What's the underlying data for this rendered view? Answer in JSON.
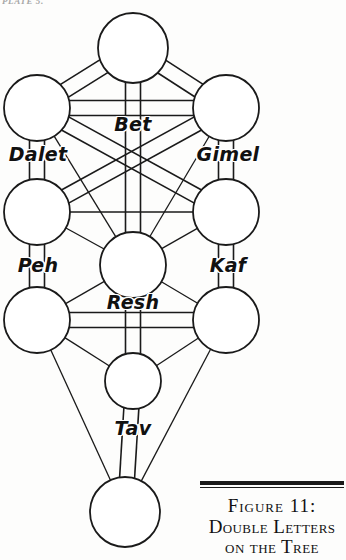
{
  "page": {
    "running_head": "PLATE 5.",
    "width": 346,
    "height": 560,
    "background_color": "#fdfdfc",
    "ink_color": "#1a1a1a"
  },
  "figure": {
    "node_stroke_color": "#1a1a1a",
    "node_fill_color": "#ffffff",
    "path_stroke_color": "#1a1a1a"
  },
  "nodes": [
    {
      "id": "keter",
      "cx": 133,
      "cy": 48,
      "r": 35
    },
    {
      "id": "binah",
      "cx": 37,
      "cy": 108,
      "r": 33
    },
    {
      "id": "chokhmah",
      "cx": 226,
      "cy": 108,
      "r": 33
    },
    {
      "id": "gevurah",
      "cx": 37,
      "cy": 212,
      "r": 33
    },
    {
      "id": "chesed",
      "cx": 226,
      "cy": 212,
      "r": 33
    },
    {
      "id": "tiferet",
      "cx": 133,
      "cy": 265,
      "r": 33
    },
    {
      "id": "hod",
      "cx": 37,
      "cy": 320,
      "r": 33
    },
    {
      "id": "netzach",
      "cx": 226,
      "cy": 320,
      "r": 33
    },
    {
      "id": "yesod",
      "cx": 133,
      "cy": 381,
      "r": 28
    },
    {
      "id": "malkuth",
      "cx": 125,
      "cy": 512,
      "r": 35
    }
  ],
  "paths": [
    {
      "from": "keter",
      "to": "binah",
      "doubled": true
    },
    {
      "from": "keter",
      "to": "chokhmah",
      "doubled": true
    },
    {
      "from": "keter",
      "to": "tiferet",
      "doubled": true
    },
    {
      "from": "binah",
      "to": "chokhmah",
      "doubled": true
    },
    {
      "from": "binah",
      "to": "gevurah",
      "doubled": true
    },
    {
      "from": "chokhmah",
      "to": "chesed",
      "doubled": true
    },
    {
      "from": "binah",
      "to": "tiferet",
      "doubled": false
    },
    {
      "from": "chokhmah",
      "to": "tiferet",
      "doubled": false
    },
    {
      "from": "binah",
      "to": "chesed",
      "doubled": true
    },
    {
      "from": "chokhmah",
      "to": "gevurah",
      "doubled": true
    },
    {
      "from": "gevurah",
      "to": "chesed",
      "doubled": false
    },
    {
      "from": "gevurah",
      "to": "tiferet",
      "doubled": false
    },
    {
      "from": "chesed",
      "to": "tiferet",
      "doubled": false
    },
    {
      "from": "gevurah",
      "to": "hod",
      "doubled": true
    },
    {
      "from": "chesed",
      "to": "netzach",
      "doubled": true
    },
    {
      "from": "hod",
      "to": "netzach",
      "doubled": true
    },
    {
      "from": "hod",
      "to": "tiferet",
      "doubled": false
    },
    {
      "from": "netzach",
      "to": "tiferet",
      "doubled": false
    },
    {
      "from": "tiferet",
      "to": "yesod",
      "doubled": true
    },
    {
      "from": "hod",
      "to": "yesod",
      "doubled": false
    },
    {
      "from": "netzach",
      "to": "yesod",
      "doubled": false
    },
    {
      "from": "yesod",
      "to": "malkuth",
      "doubled": true
    },
    {
      "from": "hod",
      "to": "malkuth",
      "doubled": false
    },
    {
      "from": "netzach",
      "to": "malkuth",
      "doubled": false
    }
  ],
  "labels": [
    {
      "id": "bet",
      "text": "Bet",
      "x": 133,
      "y": 124,
      "size": 19
    },
    {
      "id": "dalet",
      "text": "Dalet",
      "x": 38,
      "y": 154,
      "size": 19
    },
    {
      "id": "gimel",
      "text": "Gimel",
      "x": 228,
      "y": 154,
      "size": 19
    },
    {
      "id": "peh",
      "text": "Peh",
      "x": 38,
      "y": 265,
      "size": 19
    },
    {
      "id": "kaf",
      "text": "Kaf",
      "x": 228,
      "y": 265,
      "size": 19
    },
    {
      "id": "resh",
      "text": "Resh",
      "x": 133,
      "y": 302,
      "size": 19
    },
    {
      "id": "tav",
      "text": "Tav",
      "x": 133,
      "y": 428,
      "size": 19
    }
  ],
  "caption": {
    "line1": "Figure 11:",
    "line2": "Double Letters",
    "line3": "on the Tree"
  }
}
